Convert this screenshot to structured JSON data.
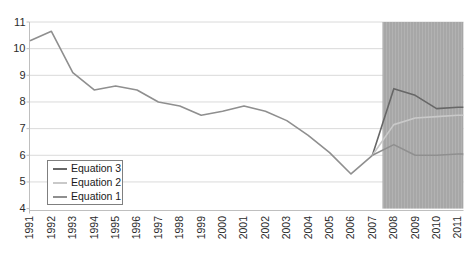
{
  "chart_data": {
    "type": "line",
    "title": "",
    "xlabel": "",
    "ylabel": "",
    "x_years": [
      1991,
      1992,
      1993,
      1994,
      1995,
      1996,
      1997,
      1998,
      1999,
      2000,
      2001,
      2002,
      2003,
      2004,
      2005,
      2006,
      2007,
      2008,
      2009,
      2010,
      2011
    ],
    "ylim": [
      4,
      11
    ],
    "yticks": [
      4,
      5,
      6,
      7,
      8,
      9,
      10,
      11
    ],
    "grid": true,
    "historical": {
      "name": "historical",
      "color": "#8f8f8f",
      "years": [
        1991,
        1992,
        1993,
        1994,
        1995,
        1996,
        1997,
        1998,
        1999,
        2000,
        2001,
        2002,
        2003,
        2004,
        2005,
        2006,
        2007
      ],
      "values": [
        10.3,
        10.65,
        9.1,
        8.45,
        8.6,
        8.45,
        8.0,
        7.85,
        7.5,
        7.65,
        7.85,
        7.65,
        7.3,
        6.75,
        6.1,
        5.3,
        6.0
      ]
    },
    "series": [
      {
        "name": "Equation 3",
        "color": "#676767",
        "years": [
          2007,
          2008,
          2009,
          2010,
          2011
        ],
        "values": [
          6.0,
          8.5,
          8.25,
          7.75,
          7.8
        ]
      },
      {
        "name": "Equation 2",
        "color": "#c9c9c9",
        "years": [
          2007,
          2008,
          2009,
          2010,
          2011
        ],
        "values": [
          6.0,
          7.15,
          7.4,
          7.45,
          7.5
        ]
      },
      {
        "name": "Equation 1",
        "color": "#8f8f8f",
        "years": [
          2007,
          2008,
          2009,
          2010,
          2011
        ],
        "values": [
          6.0,
          6.4,
          6.0,
          6.0,
          6.05
        ]
      }
    ],
    "forecast_shade": {
      "x_start": 2007.47,
      "x_end": 2011.25,
      "color": "#a7a7a7",
      "stripe_color": "#b2b2b2"
    },
    "legend": {
      "position": "bottom-left",
      "items": [
        "Equation 3",
        "Equation 2",
        "Equation 1"
      ]
    },
    "axis_color": "#bfbfbf",
    "gridline_color": "#dadada",
    "tick_label_color": "#2b2b2b"
  }
}
